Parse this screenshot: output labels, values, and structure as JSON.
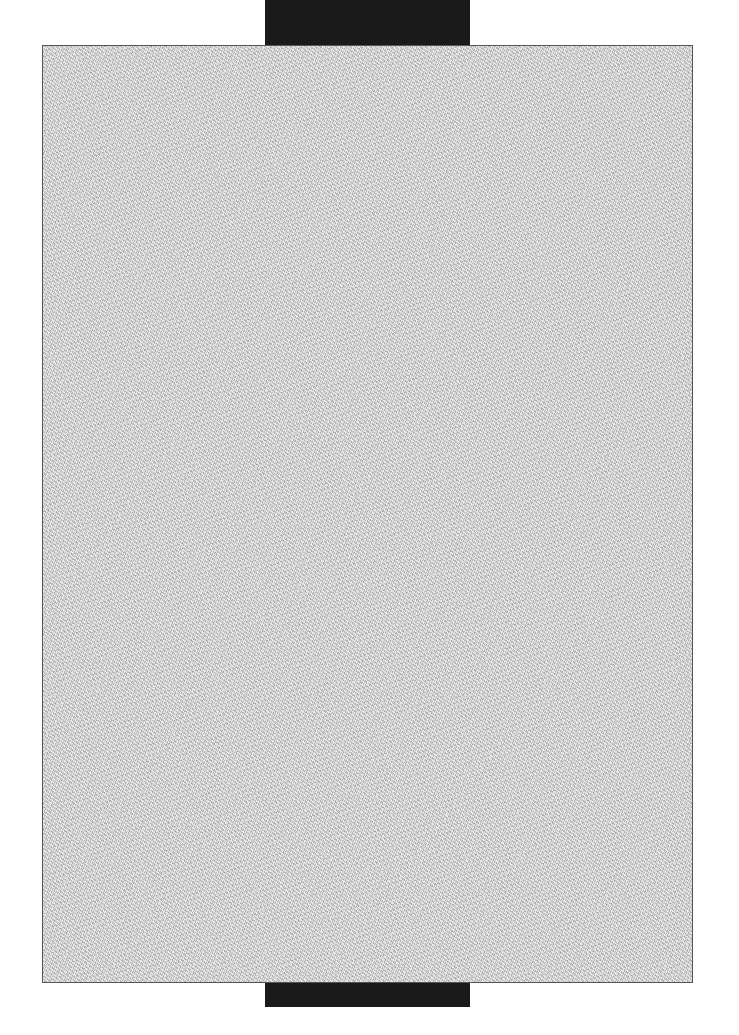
{
  "document": {
    "type": "scanned-blank-page",
    "text": "",
    "colors": {
      "page_fill": "#d6d6d6",
      "page_border": "#555555",
      "scan_bar": "#1a1a1a",
      "background": "#ffffff"
    }
  }
}
